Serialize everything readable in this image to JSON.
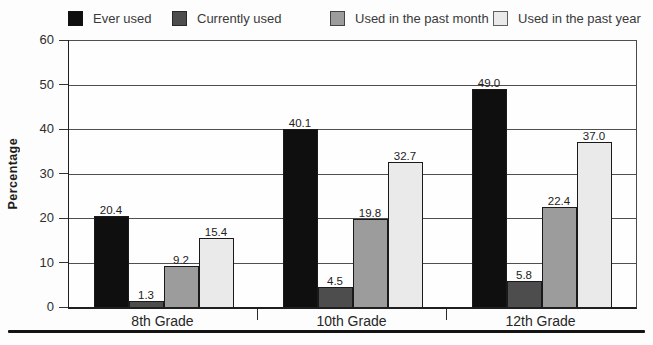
{
  "chart_data": {
    "type": "bar",
    "title": "",
    "xlabel": "",
    "ylabel": "Percentage",
    "ylim": [
      0,
      60
    ],
    "yticks": [
      0,
      10,
      20,
      30,
      40,
      50,
      60
    ],
    "grid": true,
    "legend_position": "top",
    "categories": [
      "8th Grade",
      "10th Grade",
      "12th Grade"
    ],
    "series": [
      {
        "name": "Ever used",
        "color": "#0f0f0f",
        "values": [
          20.4,
          40.1,
          49.0
        ]
      },
      {
        "name": "Currently used",
        "color": "#4d4d4d",
        "values": [
          1.3,
          4.5,
          5.8
        ]
      },
      {
        "name": "Used in the past month",
        "color": "#9c9c9c",
        "values": [
          9.2,
          19.8,
          22.4
        ]
      },
      {
        "name": "Used in the past year",
        "color": "#eaeaea",
        "values": [
          15.4,
          32.7,
          37.0
        ]
      }
    ],
    "value_label_decimals": 1
  }
}
